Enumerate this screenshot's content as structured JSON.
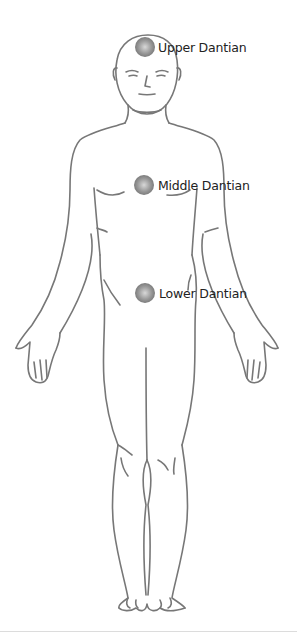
{
  "diagram": {
    "line_color": "#777777",
    "orb_color": "#808080",
    "top_fragment_text": "",
    "points": [
      {
        "id": "upper",
        "label": "Upper Dantian",
        "x": 146,
        "y": 47
      },
      {
        "id": "middle",
        "label": "Middle Dantian",
        "x": 145,
        "y": 185
      },
      {
        "id": "lower",
        "label": "Lower Dantian",
        "x": 145,
        "y": 292
      }
    ]
  }
}
